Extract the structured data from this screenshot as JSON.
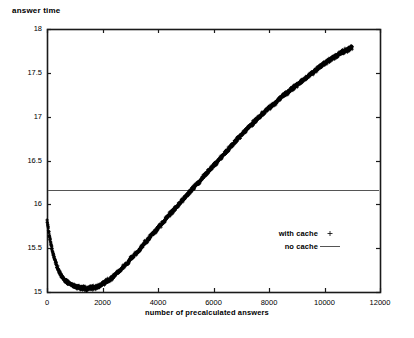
{
  "chart_data": {
    "type": "scatter",
    "title": "answer time",
    "xlabel": "number of precalculated answers",
    "ylabel": "answer time",
    "xlim": [
      0,
      12000
    ],
    "ylim": [
      15,
      18
    ],
    "grid": false,
    "xticks": [
      "0",
      "2000",
      "4000",
      "6000",
      "8000",
      "10000",
      "12000"
    ],
    "xtick_values": [
      0,
      2000,
      4000,
      6000,
      8000,
      10000,
      12000
    ],
    "yticks": [
      "15",
      "15.5",
      "16",
      "16.5",
      "17",
      "17.5",
      "18"
    ],
    "ytick_values": [
      15,
      15.5,
      16,
      16.5,
      17,
      17.5,
      18
    ],
    "legend_position": "inside-right-lower",
    "series": [
      {
        "name": "with cache",
        "type": "scatter",
        "marker": "+",
        "color": "#000000",
        "noise_amplitude": 0.035,
        "x": [
          0,
          50,
          100,
          150,
          200,
          250,
          300,
          350,
          400,
          450,
          500,
          550,
          600,
          650,
          700,
          750,
          800,
          850,
          900,
          950,
          1000,
          1100,
          1200,
          1300,
          1400,
          1500,
          1600,
          1700,
          1800,
          1900,
          2000,
          2100,
          2200,
          2300,
          2400,
          2500,
          2600,
          2700,
          2800,
          2900,
          3000,
          3100,
          3200,
          3300,
          3400,
          3500,
          3600,
          3700,
          3800,
          3900,
          4000,
          4200,
          4400,
          4600,
          4800,
          5000,
          5200,
          5400,
          5600,
          5800,
          6000,
          6200,
          6400,
          6600,
          6800,
          7000,
          7200,
          7400,
          7600,
          7800,
          8000,
          8200,
          8400,
          8600,
          8800,
          9000,
          9200,
          9400,
          9600,
          9800,
          10000,
          10200,
          10400,
          10600,
          10800,
          11000
        ],
        "y": [
          15.83,
          15.72,
          15.62,
          15.53,
          15.46,
          15.4,
          15.35,
          15.3,
          15.26,
          15.23,
          15.2,
          15.17,
          15.15,
          15.13,
          15.12,
          15.11,
          15.1,
          15.09,
          15.08,
          15.07,
          15.07,
          15.06,
          15.05,
          15.05,
          15.04,
          15.04,
          15.05,
          15.05,
          15.06,
          15.07,
          15.09,
          15.11,
          15.13,
          15.15,
          15.18,
          15.21,
          15.24,
          15.27,
          15.3,
          15.33,
          15.37,
          15.4,
          15.44,
          15.47,
          15.51,
          15.55,
          15.58,
          15.62,
          15.66,
          15.69,
          15.73,
          15.8,
          15.88,
          15.95,
          16.02,
          16.09,
          16.16,
          16.23,
          16.3,
          16.37,
          16.44,
          16.51,
          16.58,
          16.65,
          16.72,
          16.79,
          16.86,
          16.92,
          16.98,
          17.04,
          17.1,
          17.15,
          17.21,
          17.26,
          17.31,
          17.36,
          17.41,
          17.46,
          17.51,
          17.56,
          17.61,
          17.65,
          17.69,
          17.73,
          17.76,
          17.79
        ]
      },
      {
        "name": "no cache",
        "type": "line",
        "marker": "line",
        "color": "#555555",
        "value": 16.16
      }
    ],
    "legend": [
      {
        "label": "with cache",
        "marker": "+"
      },
      {
        "label": "no cache",
        "marker": "line"
      }
    ]
  },
  "colors": {
    "axis": "#1a1a1a",
    "data": "#000000",
    "reference_line": "#555555",
    "background": "#ffffff"
  }
}
